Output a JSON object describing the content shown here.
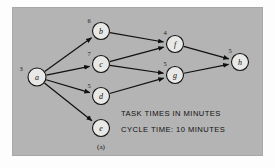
{
  "figure": {
    "caption": "(a)",
    "background_color": "#b4b4b4",
    "page_color": "#fdfdfd",
    "node_fill": "#e8e8e6",
    "line_color": "#101010"
  },
  "annotations": {
    "line1": "TASK TIMES IN MINUTES",
    "line2": "CYCLE TIME:  10 MINUTES"
  },
  "chart_data": {
    "type": "diagram",
    "nodes": [
      {
        "id": "a",
        "label": "a",
        "time": "3",
        "x": 37,
        "y": 77,
        "r": 9
      },
      {
        "id": "b",
        "label": "b",
        "time": "6",
        "x": 101,
        "y": 31,
        "r": 8.5
      },
      {
        "id": "c",
        "label": "c",
        "time": "7",
        "x": 101,
        "y": 64,
        "r": 8.5
      },
      {
        "id": "d",
        "label": "d",
        "time": "5",
        "x": 101,
        "y": 96,
        "r": 8.5
      },
      {
        "id": "e",
        "label": "e",
        "time": "2",
        "x": 101,
        "y": 128,
        "r": 8.5
      },
      {
        "id": "f",
        "label": "f",
        "time": "4",
        "x": 175,
        "y": 44,
        "r": 8.5
      },
      {
        "id": "g",
        "label": "g",
        "time": "5",
        "x": 175,
        "y": 75,
        "r": 8.5
      },
      {
        "id": "h",
        "label": "h",
        "time": "5",
        "x": 240,
        "y": 62,
        "r": 8.5
      }
    ],
    "time_label_offsets": [
      {
        "id": "a",
        "dx": -16,
        "dy": -9
      },
      {
        "id": "b",
        "dx": -12,
        "dy": -11
      },
      {
        "id": "c",
        "dx": -12,
        "dy": -11
      },
      {
        "id": "d",
        "dx": -12,
        "dy": -11
      },
      {
        "id": "e",
        "dx": -12,
        "dy": -11
      },
      {
        "id": "f",
        "dx": -10,
        "dy": -12
      },
      {
        "id": "g",
        "dx": -10,
        "dy": -12
      },
      {
        "id": "h",
        "dx": -10,
        "dy": -12
      }
    ],
    "edges": [
      {
        "from": "a",
        "to": "b"
      },
      {
        "from": "a",
        "to": "c"
      },
      {
        "from": "a",
        "to": "d"
      },
      {
        "from": "a",
        "to": "e"
      },
      {
        "from": "b",
        "to": "f"
      },
      {
        "from": "c",
        "to": "f"
      },
      {
        "from": "c",
        "to": "g"
      },
      {
        "from": "d",
        "to": "g"
      },
      {
        "from": "f",
        "to": "h"
      },
      {
        "from": "g",
        "to": "h"
      }
    ],
    "units": "minutes",
    "cycle_time": 10
  }
}
